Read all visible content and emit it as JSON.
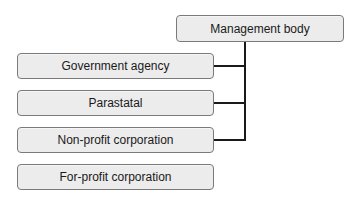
{
  "diagram": {
    "root": {
      "label": "Management body"
    },
    "children": [
      {
        "label": "Government agency",
        "connected": true
      },
      {
        "label": "Parastatal",
        "connected": true
      },
      {
        "label": "Non-profit corporation",
        "connected": true
      },
      {
        "label": "For-profit corporation",
        "connected": false
      }
    ]
  }
}
